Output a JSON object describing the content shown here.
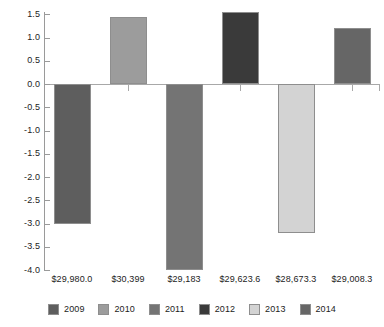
{
  "chart_data": {
    "type": "bar",
    "title": "",
    "subtitle": "",
    "xlabel": "",
    "ylabel": "",
    "categories": [
      "$29,980.0",
      "$30,399",
      "$29,183",
      "$29,623.6",
      "$28,673.3",
      "$29,008.3"
    ],
    "values": [
      -3.0,
      1.45,
      -4.0,
      1.55,
      -3.2,
      1.2
    ],
    "bars": [
      {
        "category": "$29,980.0",
        "series": "2009",
        "value": -3.0,
        "color": "#5e5e5e"
      },
      {
        "category": "$30,399",
        "series": "2010",
        "value": 1.45,
        "color": "#9c9c9c"
      },
      {
        "category": "$29,183",
        "series": "2011",
        "value": -4.0,
        "color": "#747474"
      },
      {
        "category": "$29,623.6",
        "series": "2012",
        "value": 1.55,
        "color": "#3a3a3a"
      },
      {
        "category": "$28,673.3",
        "series": "2013",
        "value": -3.2,
        "color": "#d3d3d3"
      },
      {
        "category": "$29,008.3",
        "series": "2014",
        "value": 1.2,
        "color": "#666666"
      }
    ],
    "ylim": [
      -4.0,
      1.5
    ],
    "yticks": [
      1.5,
      1.0,
      0.5,
      0.0,
      -0.5,
      -1.0,
      -1.5,
      -2.0,
      -2.5,
      -3.0,
      -3.5,
      -4.0
    ],
    "ytick_labels": [
      "1.5",
      "1.0",
      "0.5",
      "0.0",
      "-0.5",
      "-1.0",
      "-1.5",
      "-2.0",
      "-2.5",
      "-3.0",
      "-3.5",
      "-4.0"
    ],
    "grid": false,
    "zero_line": true,
    "legend": {
      "position": "bottom",
      "entries": [
        {
          "label": "2009",
          "color": "#5e5e5e"
        },
        {
          "label": "2010",
          "color": "#9c9c9c"
        },
        {
          "label": "2011",
          "color": "#747474"
        },
        {
          "label": "2012",
          "color": "#3a3a3a"
        },
        {
          "label": "2013",
          "color": "#d3d3d3"
        },
        {
          "label": "2014",
          "color": "#666666"
        }
      ]
    },
    "colors": {
      "axis": "#9a9a9a",
      "zero_line": "#a8a8a8",
      "bar_border": "#8e8e8e",
      "text": "#1c1c1c",
      "background": "#ffffff"
    }
  }
}
